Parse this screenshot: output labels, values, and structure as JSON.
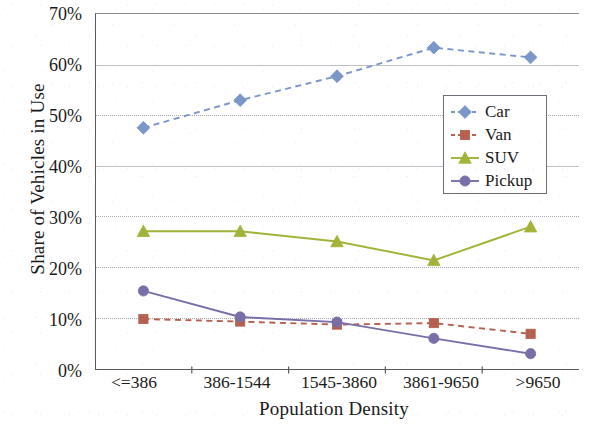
{
  "chart_data": {
    "type": "line",
    "title": "",
    "xlabel": "Population Density",
    "ylabel": "Share of Vehicles in Use",
    "categories": [
      "<=386",
      "386-1544",
      "1545-3860",
      "3861-9650",
      ">9650"
    ],
    "ylim": [
      0,
      70
    ],
    "ytick_labels": [
      "0%",
      "10%",
      "20%",
      "30%",
      "40%",
      "50%",
      "60%",
      "70%"
    ],
    "ytick_values": [
      0,
      10,
      20,
      30,
      40,
      50,
      60,
      70
    ],
    "grid": "horizontal",
    "legend_position": "inside-right",
    "series": [
      {
        "name": "Car",
        "values": [
          47.5,
          52.9,
          57.6,
          63.2,
          61.3
        ],
        "color": "#7b96c8",
        "line_style": "dashed",
        "marker": "diamond"
      },
      {
        "name": "Van",
        "values": [
          10.0,
          9.5,
          8.9,
          9.2,
          7.1
        ],
        "color": "#b5614f",
        "line_style": "dashed",
        "marker": "square"
      },
      {
        "name": "SUV",
        "values": [
          27.2,
          27.2,
          25.2,
          21.5,
          28.1
        ],
        "color": "#a3b33a",
        "line_style": "solid",
        "marker": "triangle"
      },
      {
        "name": "Pickup",
        "values": [
          15.5,
          10.4,
          9.4,
          6.2,
          3.2
        ],
        "color": "#7a6ea8",
        "line_style": "solid",
        "marker": "circle"
      }
    ]
  }
}
